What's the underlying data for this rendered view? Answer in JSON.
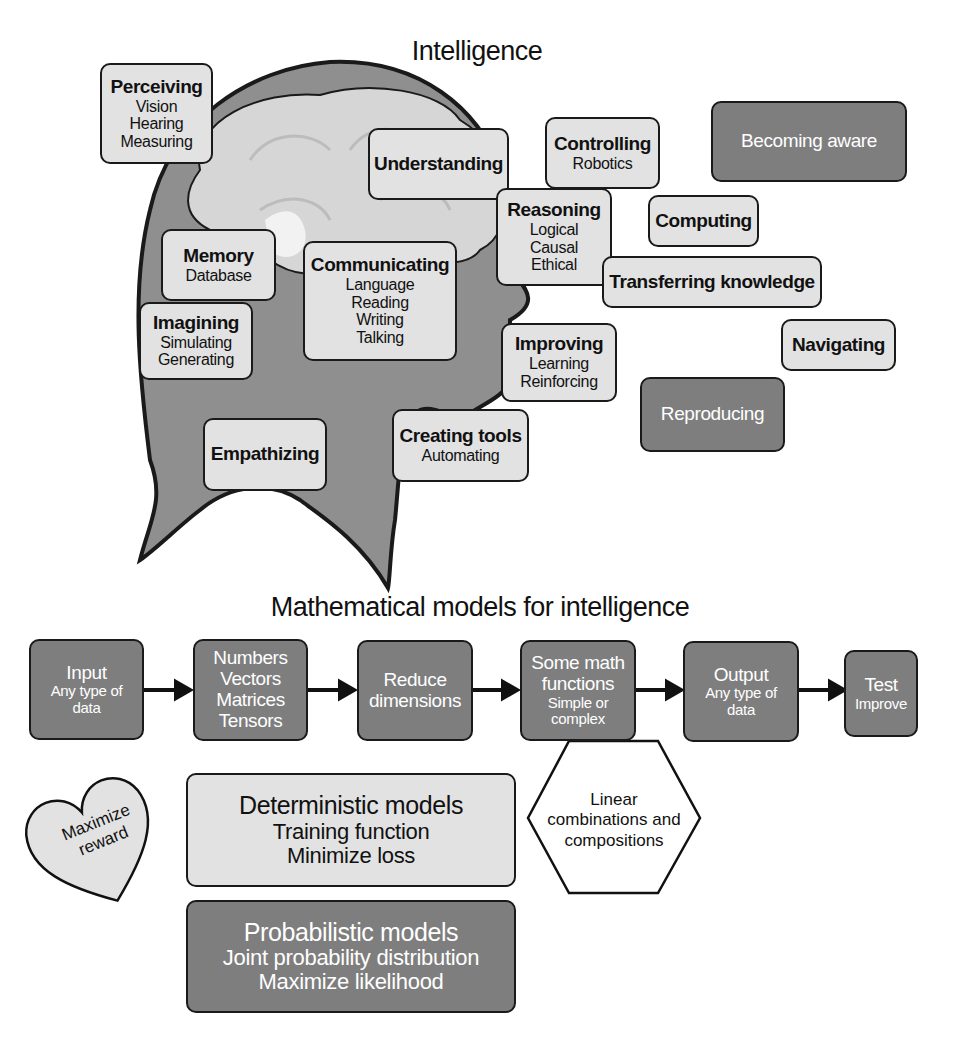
{
  "intelligence": {
    "title": "Intelligence",
    "boxes": {
      "perceiving": {
        "heading": "Perceiving",
        "lines": [
          "Vision",
          "Hearing",
          "Measuring"
        ]
      },
      "understanding": {
        "heading": "Understanding"
      },
      "controlling": {
        "heading": "Controlling",
        "lines": [
          "Robotics"
        ]
      },
      "becoming_aware": {
        "heading": "Becoming aware"
      },
      "reasoning": {
        "heading": "Reasoning",
        "lines": [
          "Logical",
          "Causal",
          "Ethical"
        ]
      },
      "computing": {
        "heading": "Computing"
      },
      "memory": {
        "heading": "Memory",
        "lines": [
          "Database"
        ]
      },
      "communicating": {
        "heading": "Communicating",
        "lines": [
          "Language",
          "Reading",
          "Writing",
          "Talking"
        ]
      },
      "transferring": {
        "heading": "Transferring knowledge"
      },
      "imagining": {
        "heading": "Imagining",
        "lines": [
          "Simulating",
          "Generating"
        ]
      },
      "improving": {
        "heading": "Improving",
        "lines": [
          "Learning",
          "Reinforcing"
        ]
      },
      "navigating": {
        "heading": "Navigating"
      },
      "reproducing": {
        "heading": "Reproducing"
      },
      "empathizing": {
        "heading": "Empathizing"
      },
      "creating_tools": {
        "heading": "Creating tools",
        "lines": [
          "Automating"
        ]
      }
    }
  },
  "models": {
    "title": "Mathematical models for intelligence",
    "flow": [
      {
        "heading": "Input",
        "lines": [
          "Any type of",
          "data"
        ]
      },
      {
        "heading": "Numbers",
        "lines": [
          "Vectors",
          "Matrices",
          "Tensors"
        ]
      },
      {
        "heading": "Reduce",
        "lines": [
          "dimensions"
        ]
      },
      {
        "heading": "Some math",
        "lines": [
          "functions",
          "Simple or",
          "complex"
        ]
      },
      {
        "heading": "Output",
        "lines": [
          "Any type of",
          "data"
        ]
      },
      {
        "heading": "Test",
        "lines": [
          "Improve"
        ]
      }
    ],
    "hexagon": {
      "lines": [
        "Linear",
        "combinations and",
        "compositions"
      ]
    },
    "heart": {
      "lines": [
        "Maximize",
        "reward"
      ]
    },
    "deterministic": {
      "heading": "Deterministic models",
      "lines": [
        "Training function",
        "Minimize loss"
      ]
    },
    "probabilistic": {
      "heading": "Probabilistic models",
      "lines": [
        "Joint probability distribution",
        "Maximize likelihood"
      ]
    }
  },
  "colors": {
    "light_box": "#e2e2e2",
    "dark_box": "#7e7e7e",
    "head": "#8f8f8f",
    "brain": "#d6d6d6",
    "outline": "#1a1a1a"
  }
}
